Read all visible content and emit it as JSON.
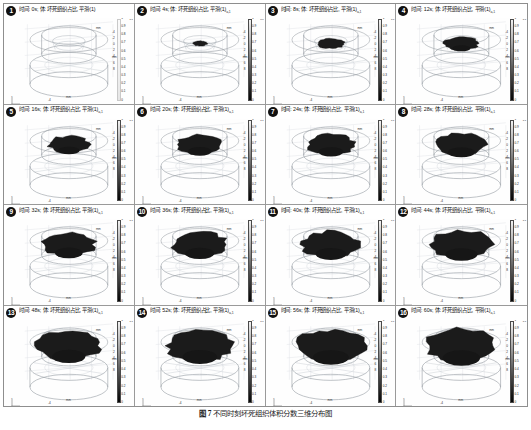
{
  "figure": {
    "caption_label": "图 7",
    "caption_text": "不同时刻坏死组织体积分数三维分布图",
    "caption_full": "图 7  不同时刻坏死组织体积分数三维分布图",
    "grid_rows": 4,
    "grid_cols": 4,
    "panel_count": 16
  },
  "title_template": {
    "time_prefix": "时间:",
    "time_unit": "s",
    "separator": ";",
    "volume_prefix": "体:",
    "quantity": "坏死组织占比",
    "smoothing": "平滑(1)",
    "subscript": "a,1"
  },
  "colorbar": {
    "label": "U",
    "label_sub": "a,1",
    "min": "0",
    "max": "1",
    "ticks": [
      "1",
      "0.9",
      "0.8",
      "0.7",
      "0.6",
      "0.5",
      "0.4",
      "0.3",
      "0.2",
      "0.1",
      "0"
    ],
    "tick_positions": [
      0,
      10,
      20,
      30,
      40,
      50,
      60,
      70,
      80,
      90,
      100
    ],
    "gradient_low_color": "#f2f2f2",
    "gradient_high_color": "#050505"
  },
  "axes": {
    "unit": "mm",
    "x_label": "mm",
    "y_label": "mm",
    "z_label": "mm",
    "z_ticks": [
      "-4",
      "-2",
      "0",
      "2",
      "4",
      "6",
      "8"
    ],
    "x_ticks": [
      "-4",
      "0",
      "4"
    ],
    "triad_labels": [
      "x",
      "y",
      "z"
    ]
  },
  "panels": [
    {
      "index": "1",
      "time": "0",
      "time_label": "0s",
      "title": "时间: 0s; 体: 坏死组织占比, 平滑(1)",
      "subscript": "",
      "blob_rx": 0.0,
      "blob_ry": 0.0,
      "has_blob": false,
      "colorbar_visible": false
    },
    {
      "index": "2",
      "time": "4",
      "time_label": "4s",
      "title": "时间: 4s; 体: 坏死组织占比, 平滑(1)",
      "subscript": "a,1",
      "blob_rx": 5.5,
      "blob_ry": 2.2,
      "has_blob": true,
      "colorbar_visible": true
    },
    {
      "index": "3",
      "time": "8",
      "time_label": "8s",
      "title": "时间: 8s; 体: 坏死组织占比, 平滑(1)",
      "subscript": "a,1",
      "blob_rx": 10.5,
      "blob_ry": 4.2,
      "has_blob": true,
      "colorbar_visible": true
    },
    {
      "index": "4",
      "time": "12",
      "time_label": "12s",
      "title": "时间: 12s; 体: 坏死组织占比, 平滑(1)",
      "subscript": "a,1",
      "blob_rx": 13.5,
      "blob_ry": 5.6,
      "has_blob": true,
      "colorbar_visible": true
    },
    {
      "index": "5",
      "time": "16",
      "time_label": "16s",
      "title": "时间: 16s; 体: 坏死组织占比, 平滑(1)",
      "subscript": "a,1",
      "blob_rx": 16.0,
      "blob_ry": 7.0,
      "has_blob": true,
      "colorbar_visible": true
    },
    {
      "index": "6",
      "time": "20",
      "time_label": "20s",
      "title": "时间: 20s; 体: 坏死组织占比, 平滑(1)",
      "subscript": "a,1",
      "blob_rx": 17.5,
      "blob_ry": 8.0,
      "has_blob": true,
      "colorbar_visible": true
    },
    {
      "index": "7",
      "time": "24",
      "time_label": "24s",
      "title": "时间: 24s; 体: 坏死组织占比, 平滑(1)",
      "subscript": "a,1",
      "blob_rx": 18.5,
      "blob_ry": 8.6,
      "has_blob": true,
      "colorbar_visible": true
    },
    {
      "index": "8",
      "time": "28",
      "time_label": "28s",
      "title": "时间: 28s; 体: 坏死组织占比, 平滑(1)",
      "subscript": "a,1",
      "blob_rx": 19.5,
      "blob_ry": 9.2,
      "has_blob": true,
      "colorbar_visible": true
    },
    {
      "index": "9",
      "time": "32",
      "time_label": "32s",
      "title": "时间: 32s; 体: 坏死组织占比, 平滑(1)",
      "subscript": "a,1",
      "blob_rx": 20.5,
      "blob_ry": 9.8,
      "has_blob": true,
      "colorbar_visible": true
    },
    {
      "index": "10",
      "time": "36",
      "time_label": "36s",
      "title": "时间: 36s; 体: 坏死组织占比, 平滑(1)",
      "subscript": "a,1",
      "blob_rx": 21.5,
      "blob_ry": 10.4,
      "has_blob": true,
      "colorbar_visible": true
    },
    {
      "index": "11",
      "time": "40",
      "time_label": "40s",
      "title": "时间: 40s; 体: 坏死组织占比, 平滑(1)",
      "subscript": "a,1",
      "blob_rx": 22.5,
      "blob_ry": 11.0,
      "has_blob": true,
      "colorbar_visible": true
    },
    {
      "index": "12",
      "time": "44",
      "time_label": "44s",
      "title": "时间: 44s; 体: 坏死组织占比, 平滑(1)",
      "subscript": "a,1",
      "blob_rx": 23.5,
      "blob_ry": 11.6,
      "has_blob": true,
      "colorbar_visible": true
    },
    {
      "index": "13",
      "time": "48",
      "time_label": "48s",
      "title": "时间: 48s; 体: 坏死组织占比, 平滑(1)",
      "subscript": "a,1",
      "blob_rx": 24.5,
      "blob_ry": 12.2,
      "has_blob": true,
      "colorbar_visible": true
    },
    {
      "index": "14",
      "time": "52",
      "time_label": "52s",
      "title": "时间: 52s; 体: 坏死组织占比, 平滑(1)",
      "subscript": "a,1",
      "blob_rx": 25.5,
      "blob_ry": 12.8,
      "has_blob": true,
      "colorbar_visible": true
    },
    {
      "index": "15",
      "time": "56",
      "time_label": "56s",
      "title": "时间: 56s; 体: 坏死组织占比, 平滑(1)",
      "subscript": "a,1",
      "blob_rx": 26.5,
      "blob_ry": 13.4,
      "has_blob": true,
      "colorbar_visible": true
    },
    {
      "index": "16",
      "time": "60",
      "time_label": "60s",
      "title": "时间: 60s; 体: 坏死组织占比, 平滑(1)",
      "subscript": "a,1",
      "blob_rx": 27.5,
      "blob_ry": 14.0,
      "has_blob": true,
      "colorbar_visible": true
    }
  ],
  "chart_data": {
    "type": "heatmap",
    "title": "不同时刻坏死组织体积分数三维分布图",
    "xlabel": "mm",
    "ylabel": "mm",
    "zlabel": "mm",
    "colorbar_label": "Ua,1",
    "colorbar_range": [
      0,
      1
    ],
    "legend_position": "right-of-each-panel",
    "grid": true,
    "x": [
      0,
      4,
      8,
      12,
      16,
      20,
      24,
      28,
      32,
      36,
      40,
      44,
      48,
      52,
      56,
      60
    ],
    "x_unit": "s",
    "series": [
      {
        "name": "坏死组织占比 (necrotic tissue fraction, peak)",
        "values": [
          0.0,
          0.35,
          0.62,
          0.78,
          0.86,
          0.91,
          0.94,
          0.96,
          0.97,
          0.98,
          0.985,
          0.99,
          0.992,
          0.994,
          0.996,
          1.0
        ]
      },
      {
        "name": "坏死区域半径 (necrotic region radius, mm)",
        "values": [
          0.0,
          0.8,
          1.6,
          2.1,
          2.5,
          2.8,
          3.0,
          3.1,
          3.3,
          3.4,
          3.6,
          3.7,
          3.9,
          4.0,
          4.2,
          4.3
        ]
      }
    ]
  }
}
